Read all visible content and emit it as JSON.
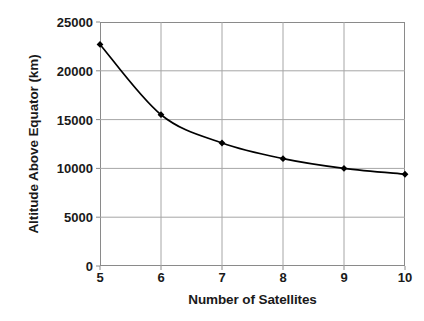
{
  "chart_data": {
    "type": "line",
    "title": "",
    "xlabel": "Number of Satellites",
    "ylabel": "Altitude Above Equator (km)",
    "x": [
      5,
      6,
      7,
      8,
      9,
      10
    ],
    "values": [
      22700,
      15500,
      12600,
      11000,
      10000,
      9400
    ],
    "series": [
      {
        "name": "Altitude Above Equator",
        "values": [
          22700,
          15500,
          12600,
          11000,
          10000,
          9400
        ]
      }
    ],
    "xlim": [
      5,
      10
    ],
    "ylim": [
      0,
      25000
    ],
    "x_ticks": [
      5,
      6,
      7,
      8,
      9,
      10
    ],
    "y_ticks": [
      0,
      5000,
      10000,
      15000,
      20000,
      25000
    ],
    "x_tick_labels": [
      "5",
      "6",
      "7",
      "8",
      "9",
      "10"
    ],
    "y_tick_labels": [
      "0",
      "5000",
      "10000",
      "15000",
      "20000",
      "25000"
    ],
    "grid": true,
    "grid_axis": "both",
    "legend": false,
    "legend_position": "none",
    "marker": "diamond",
    "line_color": "#000000",
    "marker_color": "#000000",
    "grid_color": "#a6a6a6",
    "frame_color": "#8a8a8a",
    "background_color": "#ffffff"
  },
  "axes": {
    "x_title": "Number of Satellites",
    "y_title": "Altitude Above Equator (km)"
  }
}
